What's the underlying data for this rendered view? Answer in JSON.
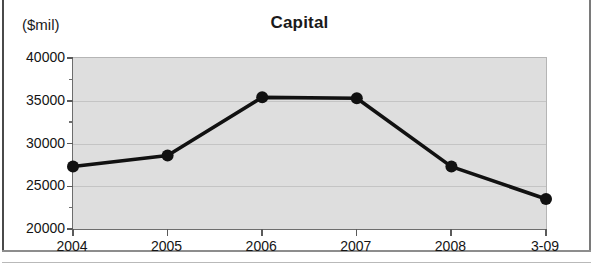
{
  "chart_data": {
    "type": "line",
    "title": "Capital",
    "ylabel": "($mil)",
    "xlabel": "",
    "categories": [
      "2004",
      "2005",
      "2006",
      "2007",
      "2008",
      "3-09"
    ],
    "values": [
      27300,
      28600,
      35400,
      35300,
      27300,
      23500
    ],
    "series": [
      {
        "name": "Capital",
        "values": [
          27300,
          28600,
          35400,
          35300,
          27300,
          23500
        ]
      }
    ],
    "ylim": [
      20000,
      40000
    ],
    "ytick_values": [
      20000,
      25000,
      30000,
      35000,
      40000
    ],
    "ytick_labels": [
      "20000",
      "25000",
      "30000",
      "35000",
      "40000"
    ],
    "yminor_values": [
      22500,
      27500,
      32500,
      37500
    ],
    "grid": true,
    "legend": "none",
    "line_color": "#111111",
    "marker_color": "#111111",
    "plot_background": "#dedede"
  }
}
